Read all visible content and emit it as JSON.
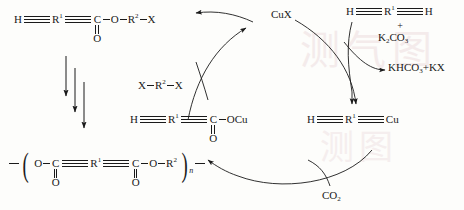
{
  "diagram": {
    "type": "reaction-scheme",
    "background_watermark": "图",
    "species": {
      "monomer_ester": {
        "id": "top-left-ester",
        "text": "H—≡—R¹—≡—C(=O)—O—R²—X",
        "parts": [
          "H",
          "R",
          "1",
          "C",
          "O",
          "O",
          "R",
          "2",
          "X"
        ]
      },
      "polymer": {
        "id": "bottom-left-polymer",
        "text": "—(—O—C(=O)—≡—R¹—≡—C(=O)—O—R²—)n—",
        "subscript": "n"
      },
      "cu_carboxylate": {
        "id": "center-cu-carboxylate",
        "text": "H—≡—R¹—≡—C(=O)—OCu"
      },
      "cu_acetylide": {
        "id": "right-cu-acetylide",
        "text": "H—≡—R¹—≡—Cu"
      },
      "diyne": {
        "id": "top-right-diyne",
        "text": "H—≡—R¹—≡—H"
      }
    },
    "labels": {
      "catalyst": "CuX",
      "dihalide": "X–R²–X",
      "base": "K₂CO₃",
      "plus": "+",
      "byproduct": "KHCO₃+KX",
      "gas": "CO₂",
      "superscript_1": "1",
      "superscript_2": "2",
      "subscript_2": "2",
      "subscript_3": "3",
      "subscript_n": "n",
      "atom_H": "H",
      "atom_C": "C",
      "atom_O": "O",
      "atom_X": "X",
      "atom_R": "R",
      "group_OCu": "OCu",
      "group_Cu": "Cu"
    },
    "colors": {
      "ink": "#1a1a1a",
      "background": "#fdfdfb",
      "watermark": "#f3e9e9"
    }
  }
}
